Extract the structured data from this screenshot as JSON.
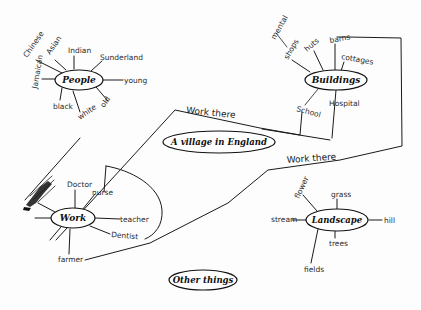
{
  "diagram": {
    "title": "A village in England",
    "type": "hand-drawn mind map",
    "center": {
      "label": "A village in England"
    },
    "nodes": {
      "people": {
        "label": "People",
        "branches": [
          "Chinese",
          "Asian",
          "Indian",
          "Sunderland",
          "young",
          "old",
          "white",
          "black",
          "Jamaican"
        ]
      },
      "buildings": {
        "label": "Buildings",
        "branches": [
          "mental",
          "shops",
          "huts",
          "barns",
          "cottages",
          "Hospital",
          "School"
        ]
      },
      "work": {
        "label": "Work",
        "branches": [
          "Doctor",
          "nurse",
          "teacher",
          "Dentist",
          "farmer",
          "scribbled label"
        ]
      },
      "landscape": {
        "label": "Landscape",
        "branches": [
          "flower",
          "grass",
          "hill",
          "trees",
          "fields",
          "stream"
        ]
      },
      "other": {
        "label": "Other things",
        "branches": []
      }
    },
    "connectors": [
      {
        "label": "Work there",
        "from": "Buildings",
        "to": "Work"
      },
      {
        "label": "Work there",
        "from": "Buildings",
        "to": "Work"
      }
    ]
  }
}
